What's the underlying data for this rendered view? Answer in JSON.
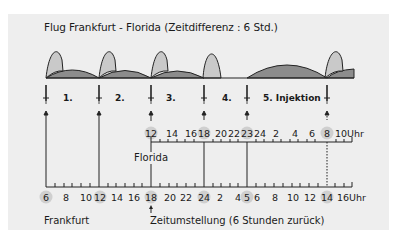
{
  "title": "Flug Frankfurt - Florida (Zeitdifferenz : 6 Std.)",
  "colors": {
    "background": "#ffffff",
    "panel": "#eeeeee",
    "peak_fill": "#c9c9c9",
    "hump_fill": "#8c8c8c",
    "line": "#222222",
    "highlight_circle": "#cfcfcf"
  },
  "injections": [
    {
      "label": "1.",
      "x": 46
    },
    {
      "label": "2.",
      "x": 99
    },
    {
      "label": "3.",
      "x": 151
    },
    {
      "label": "4.",
      "x": 204
    },
    {
      "label": "5. Injektion",
      "x": 247
    },
    {
      "label": "",
      "x": 327
    }
  ],
  "florida_axis": {
    "name": "Florida",
    "unit": "Uhr",
    "ticks": [
      "12",
      "14",
      "16",
      "18",
      "20",
      "22",
      "23",
      "24",
      "2",
      "4",
      "6",
      "8",
      "10"
    ],
    "highlighted": [
      "12",
      "18",
      "23",
      "8"
    ]
  },
  "frankfurt_axis": {
    "name": "Frankfurt",
    "unit": "Uhr",
    "ticks": [
      "6",
      "8",
      "10",
      "12",
      "14",
      "16",
      "18",
      "20",
      "22",
      "24",
      "2",
      "4",
      "5",
      "6",
      "8",
      "10",
      "12",
      "14",
      "16"
    ],
    "highlighted": [
      "6",
      "12",
      "18",
      "24",
      "5",
      "14"
    ]
  },
  "annotation": "Zeitumstellung (6 Stunden zurück)"
}
